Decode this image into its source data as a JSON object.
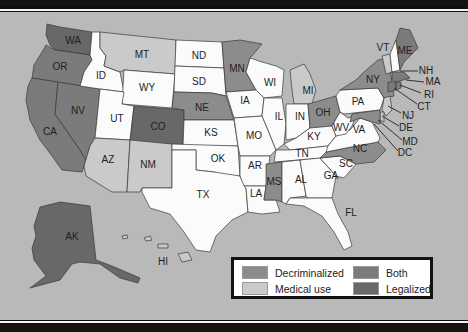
{
  "map": {
    "title": "",
    "colors": {
      "background": "#b9b9b9",
      "none": "#fbfbfb",
      "decriminalized": "#8c8c8c",
      "medical": "#cacaca",
      "both": "#7b7b7b",
      "legalized": "#686868"
    },
    "states": [
      {
        "abbr": "WA",
        "status": "legalized"
      },
      {
        "abbr": "OR",
        "status": "both"
      },
      {
        "abbr": "CA",
        "status": "both"
      },
      {
        "abbr": "NV",
        "status": "both"
      },
      {
        "abbr": "ID",
        "status": "none"
      },
      {
        "abbr": "MT",
        "status": "medical"
      },
      {
        "abbr": "WY",
        "status": "none"
      },
      {
        "abbr": "UT",
        "status": "none"
      },
      {
        "abbr": "CO",
        "status": "legalized"
      },
      {
        "abbr": "AZ",
        "status": "medical"
      },
      {
        "abbr": "NM",
        "status": "medical"
      },
      {
        "abbr": "ND",
        "status": "none"
      },
      {
        "abbr": "SD",
        "status": "none"
      },
      {
        "abbr": "NE",
        "status": "decriminalized"
      },
      {
        "abbr": "KS",
        "status": "none"
      },
      {
        "abbr": "OK",
        "status": "none"
      },
      {
        "abbr": "TX",
        "status": "none"
      },
      {
        "abbr": "MN",
        "status": "decriminalized"
      },
      {
        "abbr": "IA",
        "status": "none"
      },
      {
        "abbr": "MO",
        "status": "none"
      },
      {
        "abbr": "AR",
        "status": "none"
      },
      {
        "abbr": "LA",
        "status": "none"
      },
      {
        "abbr": "WI",
        "status": "none"
      },
      {
        "abbr": "IL",
        "status": "none"
      },
      {
        "abbr": "MI",
        "status": "medical"
      },
      {
        "abbr": "IN",
        "status": "none"
      },
      {
        "abbr": "OH",
        "status": "decriminalized"
      },
      {
        "abbr": "KY",
        "status": "none"
      },
      {
        "abbr": "TN",
        "status": "none"
      },
      {
        "abbr": "MS",
        "status": "decriminalized"
      },
      {
        "abbr": "AL",
        "status": "none"
      },
      {
        "abbr": "GA",
        "status": "none"
      },
      {
        "abbr": "FL",
        "status": "none"
      },
      {
        "abbr": "SC",
        "status": "none"
      },
      {
        "abbr": "NC",
        "status": "decriminalized"
      },
      {
        "abbr": "VA",
        "status": "none"
      },
      {
        "abbr": "WV",
        "status": "none"
      },
      {
        "abbr": "PA",
        "status": "none"
      },
      {
        "abbr": "NY",
        "status": "decriminalized"
      },
      {
        "abbr": "VT",
        "status": "medical"
      },
      {
        "abbr": "NH",
        "status": "none"
      },
      {
        "abbr": "ME",
        "status": "both"
      },
      {
        "abbr": "MA",
        "status": "both"
      },
      {
        "abbr": "RI",
        "status": "both"
      },
      {
        "abbr": "CT",
        "status": "both"
      },
      {
        "abbr": "NJ",
        "status": "medical"
      },
      {
        "abbr": "DE",
        "status": "medical"
      },
      {
        "abbr": "MD",
        "status": "decriminalized"
      },
      {
        "abbr": "DC",
        "status": "medical"
      },
      {
        "abbr": "AK",
        "status": "legalized"
      },
      {
        "abbr": "HI",
        "status": "medical"
      }
    ],
    "labels": {
      "WA": "WA",
      "OR": "OR",
      "CA": "CA",
      "NV": "NV",
      "ID": "ID",
      "MT": "MT",
      "WY": "WY",
      "UT": "UT",
      "CO": "CO",
      "AZ": "AZ",
      "NM": "NM",
      "ND": "ND",
      "SD": "SD",
      "NE": "NE",
      "KS": "KS",
      "OK": "OK",
      "TX": "TX",
      "MN": "MN",
      "IA": "IA",
      "MO": "MO",
      "AR": "AR",
      "LA": "LA",
      "WI": "WI",
      "IL": "IL",
      "MI": "MI",
      "IN": "IN",
      "OH": "OH",
      "KY": "KY",
      "TN": "TN",
      "MS": "MS",
      "AL": "AL",
      "GA": "GA",
      "FL": "FL",
      "SC": "SC",
      "NC": "NC",
      "VA": "VA",
      "WV": "WV",
      "PA": "PA",
      "NY": "NY",
      "VT": "VT",
      "NH": "NH",
      "ME": "ME",
      "MA": "MA",
      "RI": "RI",
      "CT": "CT",
      "NJ": "NJ",
      "DE": "DE",
      "MD": "MD",
      "DC": "DC",
      "AK": "AK",
      "HI": "HI"
    }
  },
  "legend": {
    "items": [
      {
        "key": "decriminalized",
        "label": "Decriminalized"
      },
      {
        "key": "medical",
        "label": "Medical use"
      },
      {
        "key": "both",
        "label": "Both"
      },
      {
        "key": "legalized",
        "label": "Legalized"
      }
    ]
  }
}
